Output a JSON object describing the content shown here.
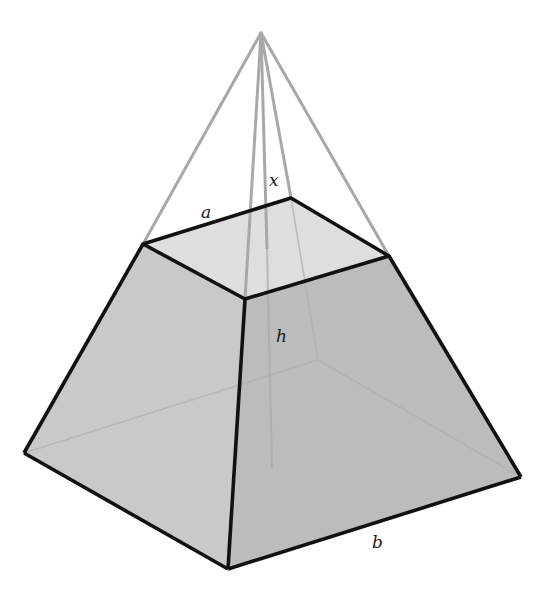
{
  "diagram": {
    "colors": {
      "background": "#ffffff",
      "edge": "#111111",
      "extension_line": "#a8a8a8",
      "hidden_line": "#b4b4b4",
      "front_left_face": "#c9c9c9",
      "front_right_face": "#bcbcbc",
      "top_face": "#dedede"
    },
    "labels": {
      "top_edge": "a",
      "apex_height": "x",
      "frustum_height": "h",
      "base_edge": "b"
    },
    "vertices": {
      "apex": [
        261,
        33
      ],
      "top_left": [
        143,
        244
      ],
      "top_back": [
        291,
        198
      ],
      "top_right": [
        389,
        256
      ],
      "top_front": [
        245,
        299
      ],
      "base_left": [
        24,
        453
      ],
      "base_back": [
        318,
        360
      ],
      "base_right": [
        521,
        477
      ],
      "base_front": [
        228,
        569
      ]
    }
  }
}
